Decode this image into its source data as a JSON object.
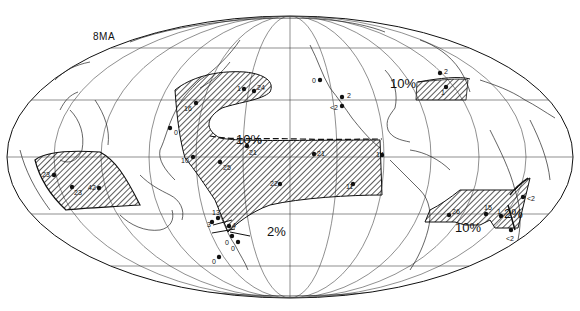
{
  "map": {
    "title": "8MA",
    "projection": "mollweide-like equal-area, pacific-centered",
    "colors": {
      "ink": "#111111",
      "background": "#ffffff",
      "hatch": "#222222",
      "graticule": "#444444"
    },
    "contours": [
      {
        "label": "10%",
        "x": 254,
        "y": 139
      },
      {
        "label": "10%",
        "x": 398,
        "y": 90
      },
      {
        "label": "2%",
        "x": 263,
        "y": 234
      },
      {
        "label": "2%",
        "x": 504,
        "y": 213
      },
      {
        "label": "10%",
        "x": 457,
        "y": 229
      }
    ],
    "sites": [
      {
        "label": "16",
        "x": 196,
        "y": 103,
        "lx": 184,
        "ly": 109
      },
      {
        "label": "1",
        "x": 244,
        "y": 89,
        "lx": 237,
        "ly": 89
      },
      {
        "label": "24",
        "x": 254,
        "y": 91,
        "lx": 257,
        "ly": 88
      },
      {
        "label": "0",
        "x": 170,
        "y": 128,
        "lx": 174,
        "ly": 133
      },
      {
        "label": "0",
        "x": 320,
        "y": 80,
        "lx": 312,
        "ly": 81
      },
      {
        "label": "2",
        "x": 342,
        "y": 97,
        "lx": 347,
        "ly": 96
      },
      {
        "label": "<2",
        "x": 342,
        "y": 106,
        "lx": 330,
        "ly": 108
      },
      {
        "label": "2",
        "x": 440,
        "y": 73,
        "lx": 444,
        "ly": 72
      },
      {
        "label": "1",
        "x": 446,
        "y": 87,
        "lx": 441,
        "ly": 93
      },
      {
        "label": "21",
        "x": 247,
        "y": 146,
        "lx": 249,
        "ly": 153
      },
      {
        "label": "21",
        "x": 314,
        "y": 154,
        "lx": 317,
        "ly": 154
      },
      {
        "label": "10",
        "x": 193,
        "y": 157,
        "lx": 181,
        "ly": 161
      },
      {
        "label": "25",
        "x": 220,
        "y": 162,
        "lx": 223,
        "ly": 168
      },
      {
        "label": "14",
        "x": 382,
        "y": 155,
        "lx": 376,
        "ly": 155
      },
      {
        "label": "22",
        "x": 280,
        "y": 184,
        "lx": 270,
        "ly": 184
      },
      {
        "label": "11",
        "x": 353,
        "y": 184,
        "lx": 346,
        "ly": 187
      },
      {
        "label": "23",
        "x": 54,
        "y": 175,
        "lx": 42,
        "ly": 175
      },
      {
        "label": "23",
        "x": 72,
        "y": 187,
        "lx": 74,
        "ly": 193
      },
      {
        "label": "42",
        "x": 99,
        "y": 188,
        "lx": 88,
        "ly": 188
      },
      {
        "label": "13",
        "x": 218,
        "y": 218,
        "lx": 212,
        "ly": 213
      },
      {
        "label": "3",
        "x": 212,
        "y": 222,
        "lx": 207,
        "ly": 225
      },
      {
        "label": "4",
        "x": 229,
        "y": 226,
        "lx": 232,
        "ly": 226
      },
      {
        "label": "0",
        "x": 232,
        "y": 236,
        "lx": 225,
        "ly": 243
      },
      {
        "label": "0",
        "x": 238,
        "y": 242,
        "lx": 231,
        "ly": 249
      },
      {
        "label": "0",
        "x": 219,
        "y": 257,
        "lx": 212,
        "ly": 262
      },
      {
        "label": "26",
        "x": 449,
        "y": 215,
        "lx": 452,
        "ly": 212
      },
      {
        "label": "15",
        "x": 486,
        "y": 214,
        "lx": 484,
        "ly": 208
      },
      {
        "label": "1",
        "x": 501,
        "y": 216,
        "lx": 497,
        "ly": 212
      },
      {
        "label": "<2",
        "x": 523,
        "y": 197,
        "lx": 527,
        "ly": 199
      },
      {
        "label": "<2",
        "x": 511,
        "y": 230,
        "lx": 506,
        "ly": 239
      }
    ]
  }
}
